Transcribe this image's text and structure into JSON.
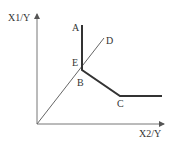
{
  "diagram": {
    "type": "isoquant",
    "axes": {
      "y_label": "X1/Y",
      "x_label": "X2/Y",
      "origin": [
        37,
        124
      ],
      "y_top": 14,
      "x_right": 164
    },
    "points": {
      "A": {
        "label": "A",
        "x": 82,
        "y": 25
      },
      "B": {
        "label": "B",
        "x": 82,
        "y": 70
      },
      "C": {
        "label": "C",
        "x": 120,
        "y": 96
      },
      "D": {
        "label": "D",
        "x": 104,
        "y": 38
      },
      "E": {
        "label": "E",
        "x": 82,
        "y": 67
      },
      "End": {
        "x": 162,
        "y": 96
      }
    },
    "curve": {
      "name": "isoquant",
      "segments": [
        "A-B",
        "B-C",
        "C-End"
      ],
      "color": "#333333"
    },
    "ray": {
      "name": "ray-OD",
      "from": "origin",
      "to": "D",
      "color": "#666666"
    }
  }
}
